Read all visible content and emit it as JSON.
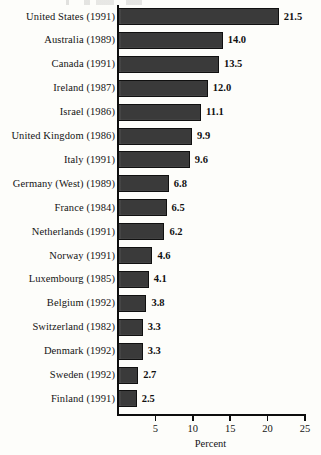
{
  "figure": {
    "background_color": "#fdfdfa",
    "bar_color": "#3a3a3a",
    "axis_color": "#0d0d0d"
  },
  "chart_data": {
    "type": "bar",
    "orientation": "horizontal",
    "title": "",
    "xlabel": "Percent",
    "ylabel": "",
    "xlim": [
      0,
      25
    ],
    "xticks": [
      5,
      10,
      15,
      20,
      25
    ],
    "xtick_labels": [
      "5",
      "10",
      "15",
      "20",
      "25"
    ],
    "grid": false,
    "legend": false,
    "show_value_labels": true,
    "categories": [
      "United States (1991)",
      "Australia (1989)",
      "Canada (1991)",
      "Ireland (1987)",
      "Israel (1986)",
      "United Kingdom (1986)",
      "Italy (1991)",
      "Germany (West) (1989)",
      "France (1984)",
      "Netherlands (1991)",
      "Norway (1991)",
      "Luxembourg (1985)",
      "Belgium (1992)",
      "Switzerland (1982)",
      "Denmark (1992)",
      "Sweden (1992)",
      "Finland (1991)"
    ],
    "values": [
      21.5,
      14.0,
      13.5,
      12.0,
      11.1,
      9.9,
      9.6,
      6.8,
      6.5,
      6.2,
      4.6,
      4.1,
      3.8,
      3.3,
      3.3,
      2.7,
      2.5
    ],
    "value_labels": [
      "21.5",
      "14.0",
      "13.5",
      "12.0",
      "11.1",
      "9.9",
      "9.6",
      "6.8",
      "6.5",
      "6.2",
      "4.6",
      "4.1",
      "3.8",
      "3.3",
      "3.3",
      "2.7",
      "2.5"
    ]
  }
}
